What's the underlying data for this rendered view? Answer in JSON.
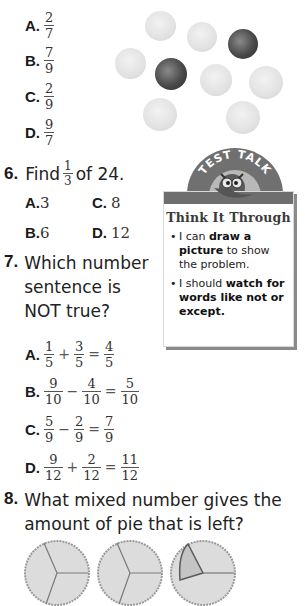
{
  "q5": {
    "options": [
      {
        "label": "A.",
        "num": "2",
        "den": "7"
      },
      {
        "label": "B.",
        "num": "7",
        "den": "9"
      },
      {
        "label": "C.",
        "num": "2",
        "den": "9"
      },
      {
        "label": "D.",
        "num": "9",
        "den": "7"
      }
    ],
    "image": {
      "description": "Group of 9 balls: 7 light tennis balls and 2 dark patterned balls",
      "light_count": 7,
      "dark_count": 2
    }
  },
  "q6": {
    "number": "6.",
    "text_before": "Find",
    "frac": {
      "num": "1",
      "den": "3"
    },
    "text_after": "of 24.",
    "options": [
      {
        "label": "A.",
        "value": "3"
      },
      {
        "label": "C.",
        "value": "8"
      },
      {
        "label": "B.",
        "value": "6"
      },
      {
        "label": "D.",
        "value": "12"
      }
    ]
  },
  "test_talk": {
    "header": "TEST TALK",
    "title": "Think It Through",
    "bullets": [
      {
        "pre": "I can ",
        "bold": "draw a picture",
        "post": " to show the problem."
      },
      {
        "pre": "I should ",
        "bold": "watch for words like not or except.",
        "post": ""
      }
    ]
  },
  "q7": {
    "number": "7.",
    "lines": [
      "Which number",
      "sentence is",
      "NOT true?"
    ],
    "options": [
      {
        "label": "A.",
        "a": [
          "1",
          "5"
        ],
        "op": "+",
        "b": [
          "3",
          "5"
        ],
        "c": [
          "4",
          "5"
        ]
      },
      {
        "label": "B.",
        "a": [
          "9",
          "10"
        ],
        "op": "−",
        "b": [
          "4",
          "10"
        ],
        "c": [
          "5",
          "10"
        ]
      },
      {
        "label": "C.",
        "a": [
          "5",
          "9"
        ],
        "op": "−",
        "b": [
          "2",
          "9"
        ],
        "c": [
          "7",
          "9"
        ]
      },
      {
        "label": "D.",
        "a": [
          "9",
          "12"
        ],
        "op": "+",
        "b": [
          "2",
          "12"
        ],
        "c": [
          "11",
          "12"
        ]
      }
    ],
    "eq": "="
  },
  "q8": {
    "number": "8.",
    "lines": [
      "What mixed number gives the",
      "amount of pie that is left?"
    ],
    "image": {
      "description": "Three pies each cut into thirds; third pie has one slice missing"
    }
  }
}
